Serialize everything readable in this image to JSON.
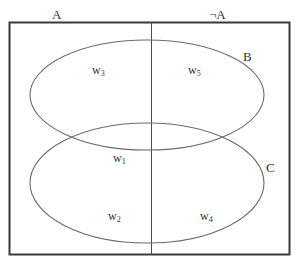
{
  "diagram": {
    "type": "venn",
    "columns": {
      "left_label": "A",
      "right_label": "¬A"
    },
    "sets": {
      "upper_label": "B",
      "lower_label": "C"
    },
    "worlds": [
      {
        "base": "w",
        "sub": "3",
        "region": "A ∩ B ∩ ¬C"
      },
      {
        "base": "w",
        "sub": "5",
        "region": "¬A ∩ B ∩ ¬C"
      },
      {
        "base": "w",
        "sub": "1",
        "region": "A ∩ B ∩ C"
      },
      {
        "base": "w",
        "sub": "2",
        "region": "A ∩ C ∩ ¬B"
      },
      {
        "base": "w",
        "sub": "4",
        "region": "¬A ∩ C ∩ ¬B"
      }
    ],
    "colors": {
      "frame": "#3a3a3a",
      "ellipse": "#6a6a6a",
      "divider": "#4a4a4a",
      "text": "#333333"
    }
  }
}
